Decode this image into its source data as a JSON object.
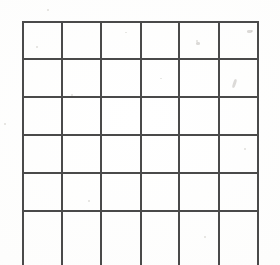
{
  "document": {
    "title": "Blank Grid Worksheet",
    "kind": "scanned-paper-grid",
    "background_color": "#fdfdfc",
    "line_color": "#4a4a4a",
    "line_thickness_px": 2
  },
  "grid": {
    "columns": 6,
    "rows": 6,
    "last_row_cropped": true,
    "cell_width_px": 39,
    "cell_height_px": 37,
    "vertical_line_x": [
      22,
      61,
      100,
      140,
      178,
      218,
      257
    ],
    "horizontal_line_y": [
      21,
      58,
      96,
      134,
      172,
      210
    ],
    "cells": [
      [
        "",
        "",
        "",
        "",
        "",
        ""
      ],
      [
        "",
        "",
        "",
        "",
        "",
        ""
      ],
      [
        "",
        "",
        "",
        "",
        "",
        ""
      ],
      [
        "",
        "",
        "",
        "",
        "",
        ""
      ],
      [
        "",
        "",
        "",
        "",
        "",
        ""
      ],
      [
        "",
        "",
        "",
        "",
        "",
        ""
      ]
    ]
  },
  "artifacts": {
    "specks": [
      {
        "x": 47,
        "y": 9,
        "w": 2,
        "h": 2
      },
      {
        "x": 196,
        "y": 40,
        "w": 2,
        "h": 2
      },
      {
        "x": 251,
        "y": 30,
        "w": 2,
        "h": 2
      },
      {
        "x": 125,
        "y": 32,
        "w": 2,
        "h": 1
      },
      {
        "x": 36,
        "y": 46,
        "w": 2,
        "h": 2
      },
      {
        "x": 71,
        "y": 94,
        "w": 2,
        "h": 2
      },
      {
        "x": 4,
        "y": 123,
        "w": 2,
        "h": 2
      },
      {
        "x": 160,
        "y": 78,
        "w": 2,
        "h": 1
      },
      {
        "x": 244,
        "y": 148,
        "w": 2,
        "h": 2
      },
      {
        "x": 88,
        "y": 200,
        "w": 2,
        "h": 2
      },
      {
        "x": 204,
        "y": 236,
        "w": 2,
        "h": 2
      }
    ],
    "smudges": [
      {
        "x": 233,
        "y": 79,
        "w": 3,
        "h": 9,
        "rot": 18
      },
      {
        "x": 196,
        "y": 42,
        "w": 4,
        "h": 3,
        "rot": 0
      },
      {
        "x": 247,
        "y": 30,
        "w": 5,
        "h": 3,
        "rot": 0
      }
    ]
  }
}
